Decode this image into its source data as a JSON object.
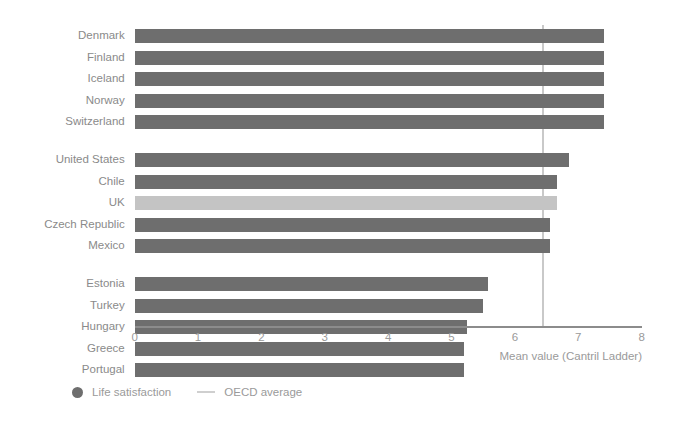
{
  "chart_data": {
    "type": "bar",
    "orientation": "horizontal",
    "title": "",
    "xlabel": "Mean value (Cantril Ladder)",
    "ylabel": "",
    "xlim": [
      0,
      8
    ],
    "xticks": [
      "0",
      "1",
      "2",
      "3",
      "4",
      "5",
      "6",
      "7",
      "8"
    ],
    "grid": false,
    "legend_position": "bottom-left",
    "groups": [
      {
        "name": "top",
        "categories": [
          "Denmark",
          "Finland",
          "Iceland",
          "Norway",
          "Switzerland"
        ],
        "values": [
          7.41,
          7.41,
          7.41,
          7.41,
          7.41
        ]
      },
      {
        "name": "middle",
        "categories": [
          "United States",
          "Chile",
          "UK",
          "Czech Republic",
          "Mexico"
        ],
        "values": [
          6.86,
          6.67,
          6.67,
          6.55,
          6.55
        ]
      },
      {
        "name": "bottom",
        "categories": [
          "Estonia",
          "Turkey",
          "Hungary",
          "Greece",
          "Portugal"
        ],
        "values": [
          5.58,
          5.5,
          5.24,
          5.2,
          5.2
        ]
      }
    ],
    "highlight_category": "UK",
    "reference_line": {
      "label": "OECD average",
      "value": 6.43
    },
    "legend": [
      {
        "label": "Life satisfaction",
        "marker": "dot",
        "color": "#6e6e6e"
      },
      {
        "label": "OECD average",
        "marker": "line",
        "color": "#cfcfcf"
      }
    ],
    "colors": {
      "bar": "#6e6e6e",
      "bar_highlight": "#c4c4c4",
      "reference_line": "#c9c9c9",
      "axis": "#8c8c8c",
      "text": "#9a9a9a",
      "background": "#ffffff"
    }
  }
}
